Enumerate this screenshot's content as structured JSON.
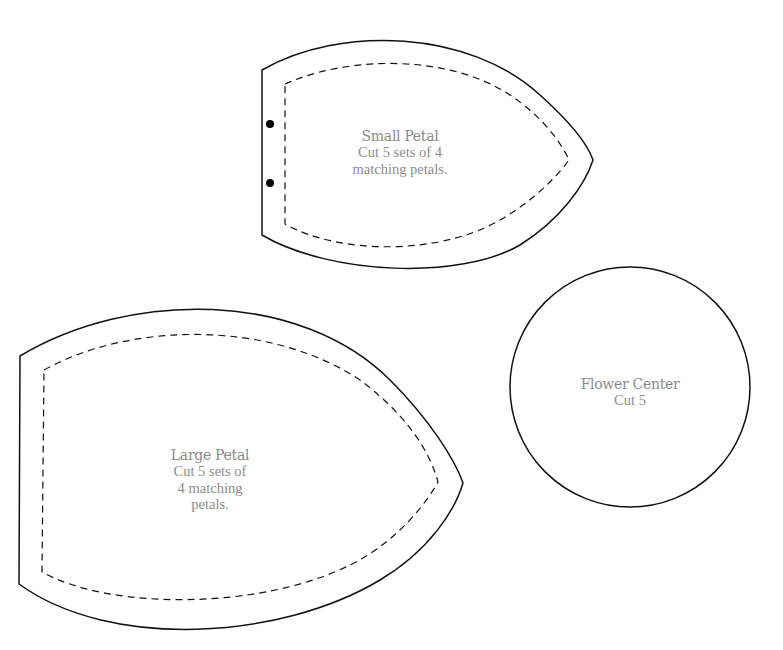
{
  "pieces": {
    "small_petal": {
      "title": "Small Petal",
      "line1": "Cut 5 sets of 4",
      "line2": "matching petals."
    },
    "large_petal": {
      "title": "Large Petal",
      "line1": "Cut 5 sets of",
      "line2": "4 matching",
      "line3": "petals."
    },
    "flower_center": {
      "title": "Flower Center",
      "line1": "Cut 5"
    }
  },
  "colors": {
    "outline": "#111111",
    "text": "#8c8c8c",
    "background": "#ffffff"
  }
}
